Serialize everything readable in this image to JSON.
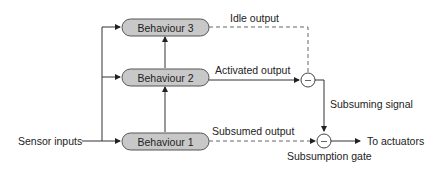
{
  "diagram": {
    "inputs": {
      "label": "Sensor inputs"
    },
    "behaviours": [
      {
        "id": "b3",
        "label": "Behaviour 3"
      },
      {
        "id": "b2",
        "label": "Behaviour 2"
      },
      {
        "id": "b1",
        "label": "Behaviour 1"
      }
    ],
    "edges": {
      "idle_output": "Idle output",
      "activated_output": "Activated output",
      "subsumed_output": "Subsumed output",
      "subsuming_signal": "Subsuming signal",
      "to_actuators": "To actuators"
    },
    "gates": {
      "subsumption_gate": "Subsumption gate",
      "gate_symbol": "–"
    },
    "colors": {
      "box_fill": "#c8c8c8",
      "box_stroke": "#555555",
      "line": "#333333",
      "dashed_line": "#666666",
      "text": "#222222"
    }
  }
}
